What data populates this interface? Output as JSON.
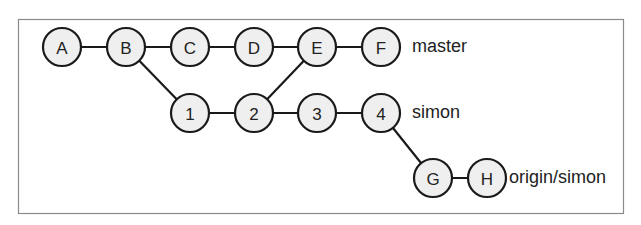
{
  "diagram": {
    "type": "git-commit-graph",
    "frame": {
      "x": 18,
      "y": 19,
      "width": 605,
      "height": 194
    },
    "node_radius": 19,
    "nodes": [
      {
        "id": "A",
        "label": "A",
        "x": 62,
        "y": 47
      },
      {
        "id": "B",
        "label": "B",
        "x": 126,
        "y": 47
      },
      {
        "id": "C",
        "label": "C",
        "x": 190,
        "y": 47
      },
      {
        "id": "D",
        "label": "D",
        "x": 254,
        "y": 47
      },
      {
        "id": "E",
        "label": "E",
        "x": 317,
        "y": 47
      },
      {
        "id": "F",
        "label": "F",
        "x": 381,
        "y": 47
      },
      {
        "id": "1",
        "label": "1",
        "x": 190,
        "y": 113
      },
      {
        "id": "2",
        "label": "2",
        "x": 254,
        "y": 113
      },
      {
        "id": "3",
        "label": "3",
        "x": 317,
        "y": 113
      },
      {
        "id": "4",
        "label": "4",
        "x": 381,
        "y": 113
      },
      {
        "id": "G",
        "label": "G",
        "x": 433,
        "y": 178
      },
      {
        "id": "H",
        "label": "H",
        "x": 487,
        "y": 178
      }
    ],
    "edges": [
      [
        "A",
        "B"
      ],
      [
        "B",
        "C"
      ],
      [
        "C",
        "D"
      ],
      [
        "D",
        "E"
      ],
      [
        "E",
        "F"
      ],
      [
        "B",
        "1"
      ],
      [
        "1",
        "2"
      ],
      [
        "2",
        "E"
      ],
      [
        "2",
        "3"
      ],
      [
        "3",
        "4"
      ],
      [
        "4",
        "G"
      ],
      [
        "G",
        "H"
      ]
    ],
    "branch_labels": [
      {
        "text": "master",
        "x": 412,
        "y": 46,
        "points_to": "F"
      },
      {
        "text": "simon",
        "x": 412,
        "y": 112,
        "points_to": "4"
      },
      {
        "text": "origin/simon",
        "x": 509,
        "y": 177,
        "points_to": "H"
      }
    ],
    "colors": {
      "node_fill": "#efefef",
      "stroke": "#1a1a1a",
      "frame": "#8a8a8a",
      "text": "#222222"
    }
  }
}
